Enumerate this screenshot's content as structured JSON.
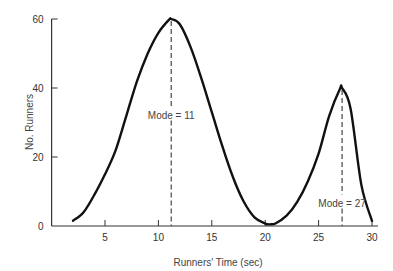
{
  "chart_data": {
    "type": "line",
    "title": "",
    "xlabel": "Runners' Time (sec)",
    "ylabel": "No. Runners",
    "xlim": [
      0,
      30
    ],
    "ylim": [
      0,
      60
    ],
    "xticks": [
      5,
      10,
      15,
      20,
      25,
      30
    ],
    "yticks": [
      0,
      20,
      40,
      60
    ],
    "grid": false,
    "legend": null,
    "series": [
      {
        "name": "Runners distribution (bimodal)",
        "x": [
          2,
          3,
          4,
          5,
          6,
          7,
          8,
          9,
          10,
          11,
          11.2,
          12,
          13,
          14,
          15,
          16,
          17,
          18,
          19,
          20,
          20.5,
          21,
          22,
          23,
          24,
          25,
          26,
          27,
          27.2,
          28,
          29,
          30
        ],
        "y": [
          1.5,
          4,
          9,
          15,
          22,
          32,
          42,
          50,
          56,
          59.8,
          60,
          58.5,
          52,
          43,
          33,
          23,
          14,
          7,
          2.5,
          0.7,
          0.5,
          0.8,
          3,
          7,
          13,
          21,
          32,
          39.8,
          40,
          34,
          12,
          1.5
        ]
      }
    ],
    "annotations": [
      {
        "text": "Mode = 11",
        "x": 11.2,
        "y": 32,
        "line_from_y": 60,
        "style": "dashed"
      },
      {
        "text": "Mode = 27",
        "x": 27.2,
        "y": 6.5,
        "line_from_y": 40,
        "style": "dashed"
      }
    ]
  },
  "labels": {
    "xlabel": "Runners' Time (sec)",
    "ylabel": "No. Runners",
    "mode1": "Mode = 11",
    "mode2": "Mode = 27"
  }
}
